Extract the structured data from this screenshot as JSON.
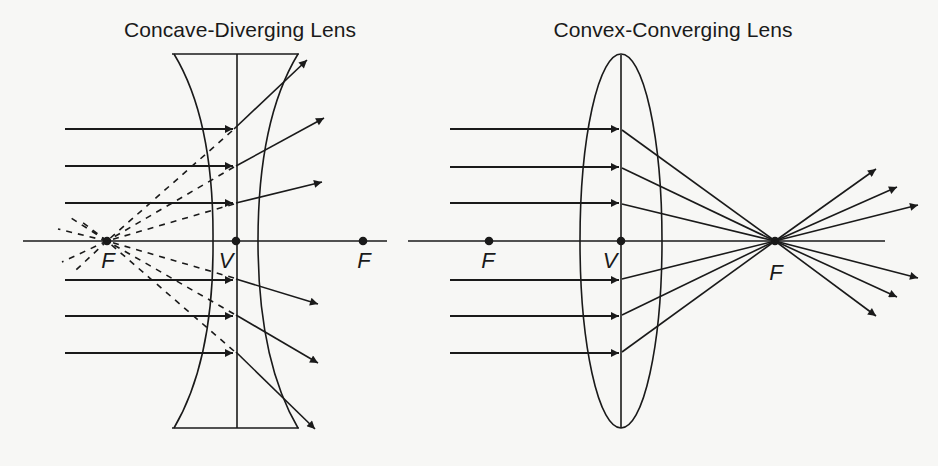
{
  "figure": {
    "background": "#f7f7f5",
    "ink": "#1a1a1a"
  },
  "diagrams": [
    {
      "id": "concave",
      "title": "Concave-Diverging Lens",
      "title_x": 240,
      "lens_type": "concave-diverging",
      "labels": [
        {
          "text": "F",
          "x": 108,
          "y": 248,
          "meaning": "virtual focal point"
        },
        {
          "text": "V",
          "x": 226,
          "y": 248,
          "meaning": "vertex"
        },
        {
          "text": "F",
          "x": 364,
          "y": 248,
          "meaning": "focal point"
        }
      ]
    },
    {
      "id": "convex",
      "title": "Convex-Converging Lens",
      "title_x": 673,
      "lens_type": "convex-converging",
      "labels": [
        {
          "text": "F",
          "x": 488,
          "y": 248,
          "meaning": "focal point"
        },
        {
          "text": "V",
          "x": 610,
          "y": 248,
          "meaning": "vertex"
        },
        {
          "text": "F",
          "x": 776,
          "y": 260,
          "meaning": "focal point"
        }
      ]
    }
  ]
}
